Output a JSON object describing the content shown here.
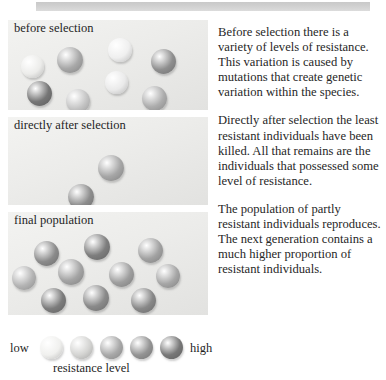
{
  "figure": {
    "top_bar_color": "#cfcfcf",
    "background_color": "#ffffff"
  },
  "panels": [
    {
      "id": "before-selection",
      "title": "before selection",
      "note": "Before selection there is a variety of levels of resistance. This variation is caused by mutations that create genetic variation within the species.",
      "organisms": [
        {
          "x": 24,
          "y": 28,
          "r": 11.5,
          "shade": 1,
          "color": "#ececea"
        },
        {
          "x": 62,
          "y": 22,
          "r": 13.0,
          "shade": 3,
          "color": "#a8a8a8"
        },
        {
          "x": 112,
          "y": 12,
          "r": 12.0,
          "shade": 1,
          "color": "#efefef"
        },
        {
          "x": 155,
          "y": 23,
          "r": 12.5,
          "shade": 4,
          "color": "#8f8f8f"
        },
        {
          "x": 31,
          "y": 55,
          "r": 12.5,
          "shade": 5,
          "color": "#767676"
        },
        {
          "x": 70,
          "y": 63,
          "r": 12.0,
          "shade": 2,
          "color": "#c4c4c4"
        },
        {
          "x": 108,
          "y": 44,
          "r": 11.5,
          "shade": 1,
          "color": "#eaeaea"
        },
        {
          "x": 146,
          "y": 60,
          "r": 12.5,
          "shade": 3,
          "color": "#adadad"
        }
      ]
    },
    {
      "id": "directly-after-selection",
      "title": "directly after selection",
      "note": "Directly after selection the least resistant individuals have been killed. All that remains are the individuals that possessed some level of resistance.",
      "organisms": [
        {
          "x": 103,
          "y": 33,
          "r": 13.0,
          "shade": 3,
          "color": "#a6a6a6"
        },
        {
          "x": 73,
          "y": 62,
          "r": 13.0,
          "shade": 4,
          "color": "#8d8d8d"
        }
      ]
    },
    {
      "id": "final-population",
      "title": "final population",
      "note": "The population of partly resistant individuals reproduces. The next generation contains a much higher proportion of resistant individuals.",
      "organisms": [
        {
          "x": 38,
          "y": 23,
          "r": 12.5,
          "shade": 4,
          "color": "#8b8b8b"
        },
        {
          "x": 89,
          "y": 17,
          "r": 13.0,
          "shade": 5,
          "color": "#7e7e7e"
        },
        {
          "x": 142,
          "y": 20,
          "r": 12.5,
          "shade": 3,
          "color": "#a2a2a2"
        },
        {
          "x": 16,
          "y": 48,
          "r": 12.0,
          "shade": 2,
          "color": "#b4b4b4"
        },
        {
          "x": 63,
          "y": 42,
          "r": 13.0,
          "shade": 3,
          "color": "#a4a4a4"
        },
        {
          "x": 113,
          "y": 44,
          "r": 12.5,
          "shade": 3,
          "color": "#9e9e9e"
        },
        {
          "x": 160,
          "y": 46,
          "r": 12.0,
          "shade": 3,
          "color": "#a6a6a6"
        },
        {
          "x": 45,
          "y": 70,
          "r": 12.5,
          "shade": 5,
          "color": "#7c7c7c"
        },
        {
          "x": 88,
          "y": 68,
          "r": 13.0,
          "shade": 4,
          "color": "#8a8a8a"
        },
        {
          "x": 135,
          "y": 70,
          "r": 12.5,
          "shade": 4,
          "color": "#888888"
        }
      ]
    }
  ],
  "legend": {
    "low_label": "low",
    "high_label": "high",
    "caption": "resistance level",
    "swatches": [
      {
        "level": 1,
        "color": "#f0f0ee"
      },
      {
        "level": 2,
        "color": "#d4d4d2"
      },
      {
        "level": 3,
        "color": "#a9a9a9"
      },
      {
        "level": 4,
        "color": "#949494"
      },
      {
        "level": 5,
        "color": "#787878"
      }
    ]
  }
}
